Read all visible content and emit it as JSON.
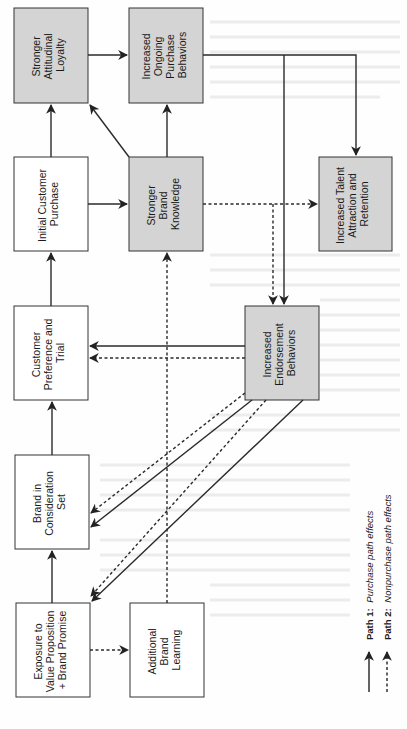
{
  "diagram": {
    "orientation": "rotated-90-ccw",
    "colors": {
      "gray_fill": "#d4d4d4",
      "white_fill": "#ffffff",
      "stroke": "#2a2a2a"
    },
    "nodes": {
      "loyalty": {
        "lines": [
          "Stronger",
          "Attitudinal",
          "Loyalty"
        ],
        "shaded": true
      },
      "ongoing": {
        "lines": [
          "Increased",
          "Ongoing",
          "Purchase",
          "Behaviors"
        ],
        "shaded": true
      },
      "initial": {
        "lines": [
          "Initial Customer",
          "Purchase"
        ],
        "shaded": false
      },
      "knowledge": {
        "lines": [
          "Stronger",
          "Brand",
          "Knowledge"
        ],
        "shaded": true
      },
      "talent": {
        "lines": [
          "Increased Talent",
          "Attraction and",
          "Retention"
        ],
        "shaded": true
      },
      "endorsement": {
        "lines": [
          "Increased",
          "Endorsement",
          "Behaviors"
        ],
        "shaded": true
      },
      "preference": {
        "lines": [
          "Customer",
          "Preference and",
          "Trial"
        ],
        "shaded": false
      },
      "consideration": {
        "lines": [
          "Brand in",
          "Consideration",
          "Set"
        ],
        "shaded": false
      },
      "exposure": {
        "lines": [
          "Exposure to",
          "Value Proposition",
          "+ Brand Promise"
        ],
        "shaded": false
      },
      "learning": {
        "lines": [
          "Additional",
          "Brand",
          "Learning"
        ],
        "shaded": false
      }
    },
    "edges": [
      {
        "from": "exposure",
        "to": "consideration",
        "style": "solid"
      },
      {
        "from": "consideration",
        "to": "preference",
        "style": "solid"
      },
      {
        "from": "preference",
        "to": "initial",
        "style": "solid"
      },
      {
        "from": "initial",
        "to": "loyalty",
        "style": "solid"
      },
      {
        "from": "initial",
        "to": "knowledge",
        "style": "solid"
      },
      {
        "from": "knowledge",
        "to": "loyalty",
        "style": "solid"
      },
      {
        "from": "knowledge",
        "to": "ongoing",
        "style": "solid"
      },
      {
        "from": "loyalty",
        "to": "ongoing",
        "style": "solid"
      },
      {
        "from": "ongoing",
        "to": "talent",
        "style": "solid"
      },
      {
        "from": "ongoing",
        "to": "endorsement",
        "style": "solid"
      },
      {
        "from": "knowledge",
        "to": "talent",
        "style": "dotted"
      },
      {
        "from": "knowledge",
        "to": "endorsement",
        "style": "dotted"
      },
      {
        "from": "endorsement",
        "to": "preference",
        "style": "solid"
      },
      {
        "from": "endorsement",
        "to": "preference",
        "style": "dotted"
      },
      {
        "from": "endorsement",
        "to": "consideration",
        "style": "solid"
      },
      {
        "from": "endorsement",
        "to": "consideration",
        "style": "dotted"
      },
      {
        "from": "endorsement",
        "to": "exposure",
        "style": "solid"
      },
      {
        "from": "endorsement",
        "to": "exposure",
        "style": "dotted"
      },
      {
        "from": "exposure",
        "to": "learning",
        "style": "dotted"
      },
      {
        "from": "learning",
        "to": "knowledge",
        "style": "dotted"
      }
    ],
    "legend": {
      "path1": {
        "label": "Path 1:",
        "desc": "Purchase path effects",
        "style": "solid"
      },
      "path2": {
        "label": "Path 2:",
        "desc": "Nonpurchase path effects",
        "style": "dotted"
      }
    }
  }
}
